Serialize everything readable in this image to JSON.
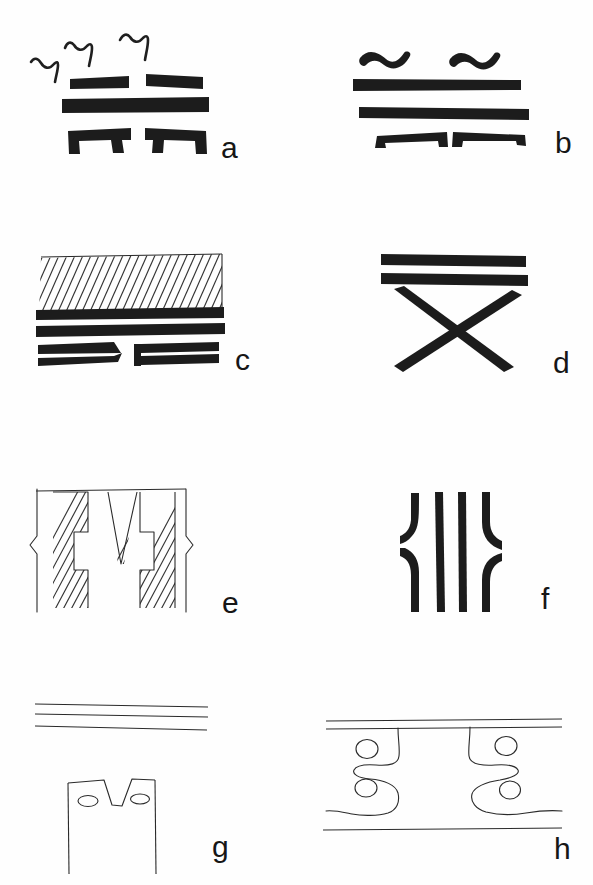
{
  "figure": {
    "kind": "line-drawing figure plate",
    "background_color": "#fefefe",
    "ink_color": "#1c1c1c",
    "width": 593,
    "height": 885,
    "columns": 2,
    "rows": 4
  },
  "panels": [
    {
      "id": "a",
      "label": "a",
      "column": "left",
      "row": 1,
      "description": "Three thick horizontal bars with wavy squiggle marks above and a bracket-shaped bar pair below",
      "elements": {
        "squiggle_count": 3,
        "thick_bars": 3,
        "bracket_bars": 2,
        "split_top_bar": true
      }
    },
    {
      "id": "b",
      "label": "b",
      "column": "right",
      "row": 1,
      "description": "Two wavy tilde marks above two full-width thick bars and a split bracket bar pair below",
      "elements": {
        "tilde_count": 2,
        "thick_bars": 2,
        "bracket_bars": 2
      }
    },
    {
      "id": "c",
      "label": "c",
      "column": "left",
      "row": 2,
      "description": "Diagonally hatched band over two thick bars, with a split thin double-line bar below",
      "elements": {
        "hatched_band": true,
        "hatch_angle_deg": 60,
        "hatch_line_count": 26,
        "thick_bars": 2,
        "lower_split_bars": 2
      }
    },
    {
      "id": "d",
      "label": "d",
      "column": "right",
      "row": 2,
      "description": "Two thick horizontal bars above a large thick X (crossed bars)",
      "elements": {
        "thick_bars": 2,
        "cross_strokes": 2
      }
    },
    {
      "id": "e",
      "label": "e",
      "column": "left",
      "row": 3,
      "description": "Sectioned view: hatched walls with a stepped slot and a central tapering wedge, bounded by break-line symbols",
      "elements": {
        "hatched_regions": 3,
        "wedge": true,
        "break_symbols": 2,
        "hatch_angle_deg": 45
      }
    },
    {
      "id": "f",
      "label": "f",
      "column": "right",
      "row": 3,
      "description": "Four thick vertical strokes; outer two are curved/offset like brackets, inner two straight",
      "elements": {
        "vertical_strokes": 4,
        "curved_strokes": 2,
        "straight_strokes": 2
      }
    },
    {
      "id": "g",
      "label": "g",
      "column": "left",
      "row": 4,
      "description": "Three thin near-horizontal lines above an outlined rectangle with a V notch and two small ellipses",
      "elements": {
        "thin_lines": 3,
        "notched_rectangle": true,
        "ellipses": 2
      }
    },
    {
      "id": "h",
      "label": "h",
      "column": "right",
      "row": 4,
      "description": "Two thin parallel rails with two mirrored S-shaped hooks, each with two small circles, above a long baseline",
      "elements": {
        "rails": 2,
        "s_hooks": 2,
        "circles": 4,
        "baseline": true
      }
    }
  ]
}
